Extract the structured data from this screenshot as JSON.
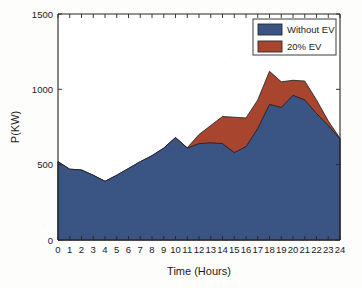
{
  "chart_data": {
    "type": "area",
    "title": "",
    "subtitle": "",
    "xlabel": "Time (Hours)",
    "ylabel": "P(KW)",
    "xlim": [
      0,
      24
    ],
    "ylim": [
      0,
      1500
    ],
    "xticks": [
      0,
      1,
      2,
      3,
      4,
      5,
      6,
      7,
      8,
      9,
      10,
      11,
      12,
      13,
      14,
      15,
      16,
      17,
      18,
      19,
      20,
      21,
      22,
      23,
      24
    ],
    "xticklabels": [
      "0",
      "1",
      "2",
      "3",
      "4",
      "5",
      "6",
      "7",
      "8",
      "9",
      "10",
      "11",
      "12",
      "13",
      "14",
      "15",
      "16",
      "17",
      "18",
      "19",
      "20",
      "21",
      "22",
      "23",
      "24"
    ],
    "yticks": [
      0,
      500,
      1000,
      1500
    ],
    "yticklabels": [
      "0",
      "500",
      "1000",
      "1500"
    ],
    "grid": false,
    "stacked_display": true,
    "legend_position": "top-right",
    "x": [
      0,
      1,
      2,
      3,
      4,
      5,
      6,
      7,
      8,
      9,
      10,
      11,
      12,
      13,
      14,
      15,
      16,
      17,
      18,
      19,
      20,
      21,
      22,
      23,
      24
    ],
    "series": [
      {
        "name": "Without EV",
        "color": "#3a5484",
        "values": [
          520,
          470,
          465,
          430,
          390,
          430,
          475,
          520,
          560,
          610,
          680,
          610,
          640,
          645,
          640,
          580,
          620,
          740,
          900,
          880,
          960,
          930,
          840,
          760,
          670
        ]
      },
      {
        "name": "20% EV",
        "color": "#a8452f",
        "note": "upper envelope (total load including EV charging)",
        "values": [
          520,
          470,
          465,
          430,
          390,
          430,
          475,
          520,
          560,
          610,
          680,
          612,
          700,
          760,
          820,
          815,
          810,
          930,
          1120,
          1050,
          1060,
          1055,
          930,
          790,
          675
        ]
      }
    ],
    "legend": [
      {
        "label": "Without EV",
        "color": "#3a5484"
      },
      {
        "label": "20% EV",
        "color": "#a8452f"
      }
    ]
  },
  "axes": {
    "ylabel": "P(KW)",
    "xlabel": "Time (Hours)"
  }
}
